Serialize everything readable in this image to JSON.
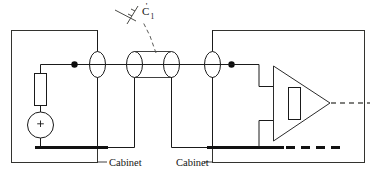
{
  "figure": {
    "type": "electrical-schematic",
    "background_color": "#ffffff",
    "line_color": "#1a1a1a",
    "ground_bar_color": "#111111"
  },
  "labels": {
    "cabinet_left": "Cabinet",
    "cabinet_right": "Cabinet",
    "capacitance_symbol": "C",
    "capacitance_subscript": "1",
    "capacitance_prime": "'"
  },
  "components": {
    "source_resistor": {
      "name": "series-resistor",
      "orientation": "vertical",
      "x": 34,
      "y": 73,
      "width": 13,
      "height": 33
    },
    "voltage_source": {
      "name": "voltage-source",
      "shape": "circle",
      "polarity_mark": "+",
      "cx": 40,
      "cy": 125,
      "r": 13
    },
    "feedback_resistor": {
      "name": "feedback-resistor",
      "orientation": "vertical",
      "x": 288,
      "y": 87,
      "width": 13,
      "height": 33
    },
    "amplifier": {
      "name": "differential-amplifier",
      "shape": "triangle",
      "apex_direction": "right",
      "apex_x": 330,
      "apex_y": 103,
      "base_x": 273,
      "base_top_y": 66,
      "base_bottom_y": 141
    },
    "feedthrough_connectors": [
      {
        "name": "feedthrough-1",
        "cx": 97,
        "cy": 64,
        "rx": 8,
        "ry": 13
      },
      {
        "name": "feedthrough-2",
        "cx": 134,
        "cy": 64,
        "rx": 8,
        "ry": 13
      },
      {
        "name": "feedthrough-3",
        "cx": 171,
        "cy": 64,
        "rx": 8,
        "ry": 13
      },
      {
        "name": "feedthrough-4",
        "cx": 212,
        "cy": 64,
        "rx": 8,
        "ry": 13
      }
    ],
    "cable_shield": {
      "name": "shielded-cable",
      "x1": 134,
      "x2": 171,
      "top_y": 51,
      "bottom_y": 77
    },
    "junction_dots": [
      {
        "name": "junction-dot-left",
        "cx": 74,
        "cy": 64,
        "r": 3
      },
      {
        "name": "junction-dot-right",
        "cx": 231,
        "cy": 64,
        "r": 3
      }
    ]
  },
  "cabinets": {
    "left": {
      "name": "cabinet-left-enclosure",
      "x": 11,
      "y": 30,
      "width": 86,
      "height": 133
    },
    "right": {
      "name": "cabinet-right-enclosure",
      "x": 212,
      "y": 30,
      "width": 153,
      "height": 133
    }
  },
  "ground_bars": {
    "left": {
      "x1": 34,
      "x2": 108,
      "y": 148
    },
    "right": {
      "x1": 207,
      "x2": 283,
      "y": 148
    },
    "right_dashed": {
      "x1": 283,
      "x2": 340,
      "y": 148
    }
  },
  "output": {
    "name": "amplifier-output",
    "style": "dashed",
    "x1": 330,
    "x2": 370,
    "y": 103
  }
}
